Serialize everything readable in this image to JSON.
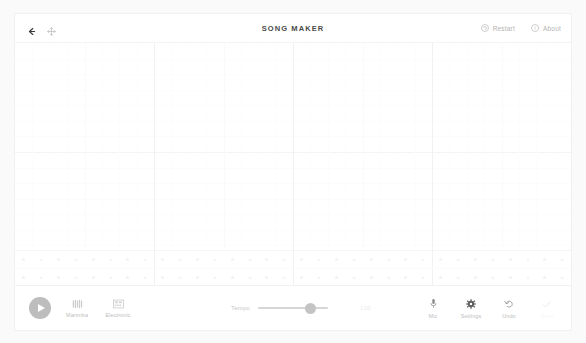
{
  "app": {
    "title": "SONG MAKER",
    "background": "#fafafa",
    "card_background": "#ffffff"
  },
  "header": {
    "back_icon": "back-arrow-icon",
    "move_icon": "move-crosshair-icon",
    "restart": {
      "label": "Restart",
      "icon": "restart-circle-icon"
    },
    "about": {
      "label": "About",
      "icon": "about-info-icon"
    }
  },
  "grid": {
    "columns": 32,
    "bars": 4,
    "beats_per_bar": 8,
    "melody_rows": 14,
    "percussion_rows": 2,
    "notes": [],
    "line_color": "#f4f4f4",
    "bar_line_color": "#f1f1f1"
  },
  "toolbar": {
    "play": {
      "label": "Play",
      "icon": "play-triangle-icon",
      "color": "#bdbdbd"
    },
    "instruments": [
      {
        "label": "Marimba",
        "icon": "marimba-bars-icon",
        "selected": true
      },
      {
        "label": "Electronic",
        "icon": "electronic-drum-icon",
        "selected": false
      }
    ],
    "tempo": {
      "label": "Tempo",
      "value": "120",
      "min": "40",
      "max": "240",
      "percent": 80
    },
    "tools": [
      {
        "label": "Mic",
        "icon": "microphone-icon",
        "disabled": false
      },
      {
        "label": "Settings",
        "icon": "gear-icon",
        "disabled": false
      },
      {
        "label": "Undo",
        "icon": "undo-arrow-icon",
        "disabled": false
      },
      {
        "label": "Save",
        "icon": "save-check-icon",
        "disabled": true
      }
    ]
  }
}
